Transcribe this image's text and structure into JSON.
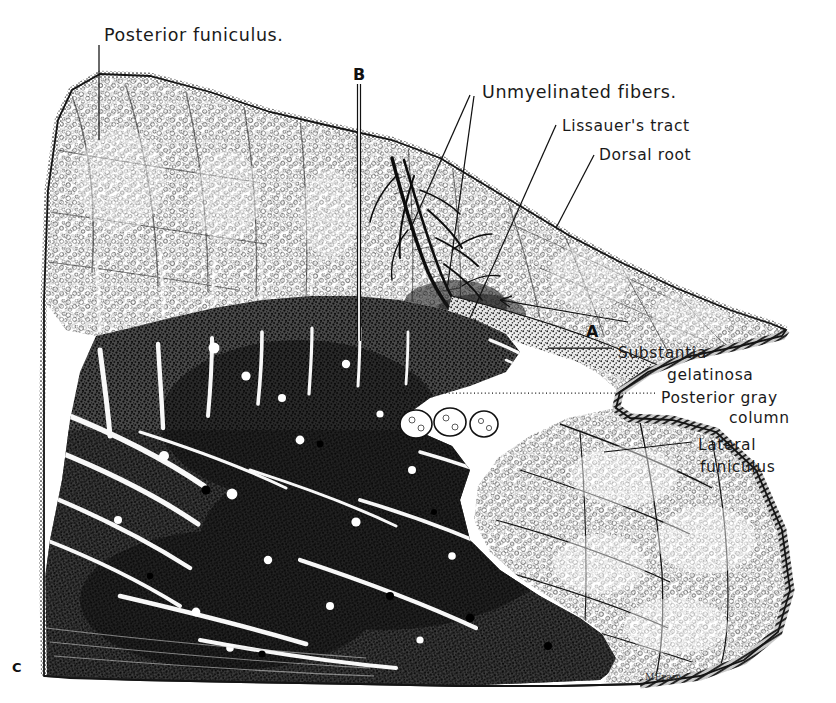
{
  "figure": {
    "kind": "anatomical-illustration",
    "background_color": "#ffffff",
    "ink_color": "#1a1a1a"
  },
  "labels": [
    {
      "id": "posterior-funiculus",
      "text": "Posterior funiculus.",
      "x": 104,
      "y": 25,
      "size": "main"
    },
    {
      "id": "unmyelinated-fibers",
      "text": "Unmyelinated fibers.",
      "x": 482,
      "y": 82,
      "size": "main"
    },
    {
      "id": "lissauers-tract",
      "text": "Lissauer's tract",
      "x": 562,
      "y": 117,
      "size": "sm"
    },
    {
      "id": "dorsal-root",
      "text": "Dorsal root",
      "x": 599,
      "y": 146,
      "size": "sm"
    },
    {
      "id": "substantia-line1",
      "text": "Substantia",
      "x": 618,
      "y": 344,
      "size": "sm"
    },
    {
      "id": "substantia-line2",
      "text": "gelatinosa",
      "x": 667,
      "y": 366,
      "size": "sm"
    },
    {
      "id": "posterior-gray-line1",
      "text": "Posterior gray",
      "x": 661,
      "y": 389,
      "size": "sm"
    },
    {
      "id": "posterior-gray-line2",
      "text": "column",
      "x": 729,
      "y": 409,
      "size": "sm"
    },
    {
      "id": "lateral-funiculus-line1",
      "text": "Lateral",
      "x": 698,
      "y": 436,
      "size": "sm"
    },
    {
      "id": "lateral-funiculus-line2",
      "text": "funiculus",
      "x": 700,
      "y": 458,
      "size": "sm"
    }
  ],
  "markers": [
    {
      "id": "marker-b",
      "text": "B",
      "x": 353,
      "y": 65
    },
    {
      "id": "marker-a",
      "text": "A",
      "x": 586,
      "y": 322
    },
    {
      "id": "marker-c",
      "text": "C",
      "x": 12,
      "y": 660
    }
  ],
  "signature": {
    "text": "MFrain",
    "x": 645,
    "y": 672
  },
  "regions": [
    {
      "id": "posterior-funiculus-region",
      "name": "Posterior funiculus",
      "texture": "myelinated-ring-stipple"
    },
    {
      "id": "dorsal-root-region",
      "name": "Dorsal root",
      "texture": "myelinated-ring-stipple"
    },
    {
      "id": "lissauers-tract-region",
      "name": "Lissauer's tract",
      "texture": "fine-dark-stipple"
    },
    {
      "id": "substantia-gelatinosa-region",
      "name": "Substantia gelatinosa",
      "texture": "light-band"
    },
    {
      "id": "posterior-gray-column-region",
      "name": "Posterior gray column",
      "texture": "dense-dark-stipple"
    },
    {
      "id": "lateral-funiculus-region",
      "name": "Lateral funiculus",
      "texture": "myelinated-ring-stipple"
    },
    {
      "id": "unmyelinated-fiber-bundle",
      "name": "Unmyelinated fibers",
      "texture": "dark-branching-tree"
    }
  ],
  "leaders": [
    {
      "id": "leader-posterior-funiculus",
      "from": [
        99,
        45
      ],
      "to": [
        99,
        140
      ]
    },
    {
      "id": "leader-unmyelinated-1",
      "from": [
        470,
        95
      ],
      "to": [
        410,
        230
      ]
    },
    {
      "id": "leader-unmyelinated-2",
      "from": [
        474,
        96
      ],
      "to": [
        447,
        290
      ]
    },
    {
      "id": "leader-lissauers",
      "from": [
        556,
        125
      ],
      "to": [
        470,
        318
      ]
    },
    {
      "id": "leader-dorsal-root",
      "from": [
        594,
        155
      ],
      "to": [
        556,
        228
      ]
    },
    {
      "id": "leader-a-arrow",
      "from": [
        600,
        318
      ],
      "to": [
        495,
        300
      ]
    },
    {
      "id": "leader-substantia",
      "from": [
        612,
        348
      ],
      "to": [
        548,
        348
      ]
    },
    {
      "id": "leader-posterior-gray",
      "from": [
        655,
        393
      ],
      "to": [
        392,
        393
      ]
    },
    {
      "id": "leader-lateral-funiculus",
      "from": [
        692,
        442
      ],
      "to": [
        604,
        452
      ]
    }
  ],
  "section_line_b": {
    "id": "section-line-b",
    "from": [
      359,
      84
    ],
    "to": [
      359,
      341
    ]
  }
}
